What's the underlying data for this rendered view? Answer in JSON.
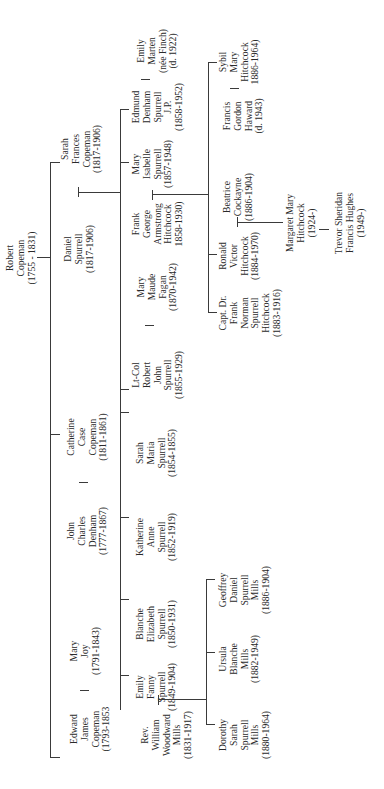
{
  "diagram": {
    "type": "family-tree",
    "orientation": "rotated-90-ccw"
  },
  "people": {
    "robert": [
      "Robert",
      "Copeman",
      "(1755 - 1831)"
    ],
    "sarah_frances": [
      "Sarah",
      "Frances",
      "Copeman",
      "(1817-1906)"
    ],
    "daniel": [
      "Daniel",
      "Spurrell",
      "(1817-1906)"
    ],
    "catherine": [
      "Catherine",
      "Case",
      "Copeman",
      "(1811-1861)"
    ],
    "john_charles": [
      "John",
      "Charles",
      "Denham",
      "(1777-1867)"
    ],
    "mary_joy": [
      "Mary",
      "Joy",
      "(1791-1843)"
    ],
    "edward": [
      "Edward",
      "James",
      "Copeman",
      "(1793-1853"
    ],
    "edmund": [
      "Edmund",
      "Denham",
      "Spurrell",
      "J.P.",
      "(1858-1952)"
    ],
    "emily_marten": [
      "Emily",
      "Marten",
      "(née Finch)",
      "(d. 1922)"
    ],
    "mary_isabelle": [
      "Mary",
      "Isabelle",
      "Spurrell",
      "(1857-1948)"
    ],
    "frank_george": [
      "Frank",
      "George",
      "Armstrong",
      "Hitchcock",
      "1858-1930)"
    ],
    "mary_maude": [
      "Mary",
      "Maude",
      "Fagan",
      "(1870-1942)"
    ],
    "lt_col_robert": [
      "Lt-Col",
      "Robert",
      "John",
      "Spurrell",
      "(1855-1929)"
    ],
    "sarah_maria": [
      "Sarah",
      "Maria",
      "Spurrell",
      "(1854-1855)"
    ],
    "katherine": [
      "Katherine",
      "Anne",
      "Spurrell",
      "(1852-1919)"
    ],
    "blanche": [
      "Blanche",
      "Elizabeth",
      "Spurrell",
      "(1850-1931)"
    ],
    "emily_fanny": [
      "Emily",
      "Fanny",
      "Spurrell",
      "(1849-1904)"
    ],
    "rev_william": [
      "Rev.",
      "William",
      "Woodward",
      "Mills",
      "(1831-1917)"
    ],
    "francis_gordon": [
      "Francis",
      "Gordon",
      "Haward",
      "(d. 1943)"
    ],
    "sybil": [
      "Sybil",
      "Mary",
      "Hitchcock",
      "1886-1964)"
    ],
    "beatrice": [
      "Beatrice",
      "Cockayne",
      "(1886-1904)"
    ],
    "ronald": [
      "Ronald",
      "Victor",
      "Hitchcock",
      "(1884-1970)"
    ],
    "capt_frank": [
      "Capt. Dr.",
      "Frank",
      "Norman",
      "Spurrell",
      "Hitchcock",
      "(1883-1916)"
    ],
    "margaret": [
      "Margaret Mary",
      "Hitchcock",
      "(1924-)"
    ],
    "trevor": [
      "Trevor Sheridan",
      "Francis Hughes",
      "(1949-)"
    ],
    "geoffrey": [
      "Geoffrey",
      "Daniel",
      "Spurrell",
      "Mills",
      "(1886-1904)"
    ],
    "ursula": [
      "Ursula",
      "Blanche",
      "Mills",
      "(1882-1949)"
    ],
    "dorothy": [
      "Dorothy",
      "Sarah",
      "Spurrell",
      "Mills",
      "(1880-1964)"
    ]
  }
}
